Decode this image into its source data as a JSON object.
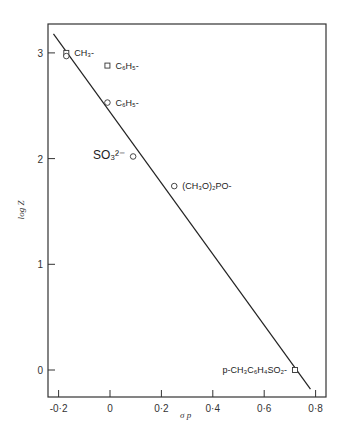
{
  "chart_data": {
    "type": "scatter",
    "title": "",
    "xlabel": "σ p",
    "ylabel": "log Z",
    "xlim": [
      -0.24,
      0.84
    ],
    "ylim": [
      -0.26,
      3.25
    ],
    "xticks": [
      -0.2,
      0,
      0.2,
      0.4,
      0.6,
      0.8
    ],
    "xtick_labels": [
      "-0·2",
      "0",
      "0·2",
      "0·4",
      "0·6",
      "0·8"
    ],
    "yticks": [
      0,
      1,
      2,
      3
    ],
    "ytick_labels": [
      "0",
      "1",
      "2",
      "3"
    ],
    "grid": false,
    "points": [
      {
        "label": "CH₃-",
        "x": -0.17,
        "y": 3.0,
        "marker": "square"
      },
      {
        "label": "",
        "x": -0.17,
        "y": 2.97,
        "marker": "circle"
      },
      {
        "label": "C₆H₅-",
        "x": -0.01,
        "y": 2.88,
        "marker": "square"
      },
      {
        "label": "C₆H₅-",
        "x": -0.01,
        "y": 2.53,
        "marker": "circle"
      },
      {
        "label": "SO₃²⁻",
        "x": 0.09,
        "y": 2.02,
        "marker": "circle",
        "label_side": "left"
      },
      {
        "label": "(CH₃O)₂PO-",
        "x": 0.25,
        "y": 1.74,
        "marker": "circle"
      },
      {
        "label": "p-CH₃C₆H₄SO₂-",
        "x": 0.72,
        "y": 0.0,
        "marker": "square",
        "label_side": "left"
      }
    ],
    "fit_line": {
      "x": [
        -0.22,
        0.78
      ],
      "y": [
        3.18,
        -0.18
      ]
    }
  }
}
